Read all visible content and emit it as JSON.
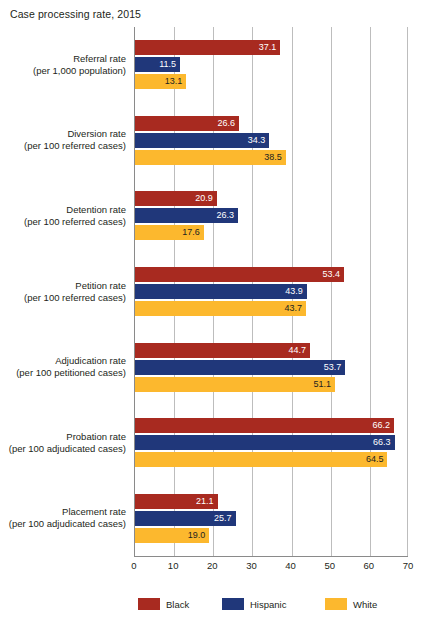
{
  "chart_data": {
    "type": "bar",
    "orientation": "horizontal",
    "title": "Case processing rate, 2015",
    "xlabel": "",
    "ylabel": "",
    "xlim": [
      0,
      70
    ],
    "xticks": [
      "0",
      "10",
      "20",
      "30",
      "40",
      "50",
      "60",
      "70"
    ],
    "grid": true,
    "legend_position": "bottom",
    "categories": [
      {
        "line1": "Referral rate",
        "line2": "(per 1,000 population)"
      },
      {
        "line1": "Diversion rate",
        "line2": "(per 100 referred cases)"
      },
      {
        "line1": "Detention rate",
        "line2": "(per 100 referred cases)"
      },
      {
        "line1": "Petition rate",
        "line2": "(per 100 referred cases)"
      },
      {
        "line1": "Adjudication rate",
        "line2": "(per 100 petitioned cases)"
      },
      {
        "line1": "Probation rate",
        "line2": "(per 100 adjudicated cases)"
      },
      {
        "line1": "Placement rate",
        "line2": "(per 100 adjudicated cases)"
      }
    ],
    "series": [
      {
        "name": "Black",
        "color": "#a82a20",
        "values": [
          37.1,
          26.6,
          20.9,
          53.4,
          44.7,
          66.2,
          21.1
        ],
        "labels": [
          "37.1",
          "26.6",
          "20.9",
          "53.4",
          "44.7",
          "66.2",
          "21.1"
        ]
      },
      {
        "name": "Hispanic",
        "color": "#20377a",
        "values": [
          11.5,
          34.3,
          26.3,
          43.9,
          53.7,
          66.3,
          25.7
        ],
        "labels": [
          "11.5",
          "34.3",
          "26.3",
          "43.9",
          "53.7",
          "66.3",
          "25.7"
        ]
      },
      {
        "name": "White",
        "color": "#fcb82e",
        "values": [
          13.1,
          38.5,
          17.6,
          43.7,
          51.1,
          64.5,
          19.0
        ],
        "labels": [
          "13.1",
          "38.5",
          "17.6",
          "43.7",
          "51.1",
          "64.5",
          "19.0"
        ]
      }
    ]
  },
  "legend": [
    {
      "label": "Black",
      "color": "#a82a20"
    },
    {
      "label": "Hispanic",
      "color": "#20377a"
    },
    {
      "label": "White",
      "color": "#fcb82e"
    }
  ]
}
